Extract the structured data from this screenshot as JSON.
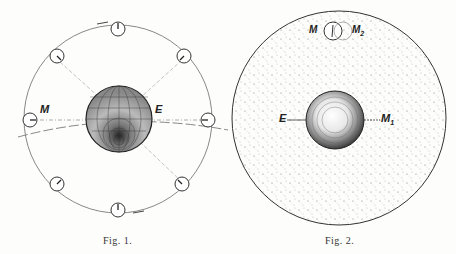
{
  "figures": [
    {
      "caption": "Fig. 1.",
      "labels": {
        "moon": "M",
        "earth": "E"
      }
    },
    {
      "caption": "Fig. 2.",
      "labels": {
        "moon_top_left": "M",
        "moon_top_right": "M",
        "moon_top_right_sub": "2",
        "earth": "E",
        "moon_right": "M",
        "moon_right_sub": "1"
      }
    }
  ]
}
